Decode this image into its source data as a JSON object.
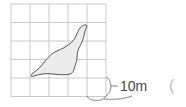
{
  "figure": {
    "type": "grid-area-estimation",
    "grid": {
      "columns": 5,
      "rows": 5,
      "line_color": "#bdbdbd"
    },
    "shape": {
      "name": "pond",
      "fill": "#ececec",
      "stroke": "#555555"
    },
    "scale_label": "10m",
    "answer_bracket": "("
  }
}
